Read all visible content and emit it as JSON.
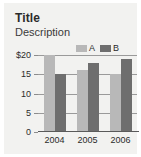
{
  "card": {
    "background_color": "#f2f2f0",
    "page_background_color": "#ffffff"
  },
  "header": {
    "title": "Title",
    "description": "Description"
  },
  "legend": {
    "position": "top-right",
    "entries": [
      {
        "label": "A",
        "color": "#b8b8b8",
        "icon": "legend-swatch-icon"
      },
      {
        "label": "B",
        "color": "#6e6e6e",
        "icon": "legend-swatch-icon"
      }
    ]
  },
  "axes": {
    "y_ticks": [
      "$20",
      "15",
      "10",
      "5",
      "0"
    ],
    "y_tick_values": [
      20,
      15,
      10,
      5,
      0
    ],
    "x_ticks": [
      "2004",
      "2005",
      "2006"
    ]
  },
  "chart_data": {
    "type": "bar",
    "title": "Title",
    "subtitle": "Description",
    "xlabel": "",
    "ylabel": "",
    "categories": [
      "2004",
      "2005",
      "2006"
    ],
    "series": [
      {
        "name": "A",
        "color": "#b8b8b8",
        "values": [
          20,
          16,
          15
        ]
      },
      {
        "name": "B",
        "color": "#6e6e6e",
        "values": [
          15,
          18,
          19
        ]
      }
    ],
    "ylim": [
      0,
      20
    ],
    "ytick_labels": [
      "$20",
      "15",
      "10",
      "5",
      "0"
    ],
    "ytick_values": [
      20,
      15,
      10,
      5,
      0
    ],
    "grid": true,
    "grid_axis": "y",
    "legend": true,
    "legend_position": "top-right",
    "bar_mode": "grouped"
  }
}
